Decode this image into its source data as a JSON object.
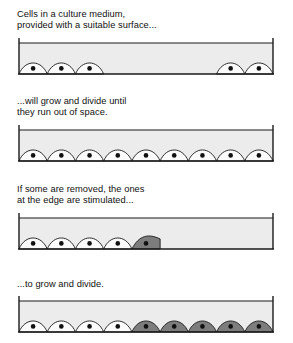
{
  "figure": {
    "background_color": "#ffffff",
    "text_color": "#111111"
  },
  "colors": {
    "medium_fill": "#ececec",
    "cell_light_fill": "#fbfbfb",
    "cell_dark_fill": "#7d7d7d",
    "nucleus": "#111111",
    "outline": "#1a1a1a",
    "surface_line": "#1a1a1a"
  },
  "panels": [
    {
      "id": "panel-1",
      "caption": "Cells in a culture medium,\nprovided with a suitable surface...",
      "dish": {
        "width": 258,
        "height": 40,
        "wall_top": 2,
        "floor_y": 38,
        "cell_count": 5,
        "cells": [
          {
            "index": 0,
            "slot": 0,
            "state": "normal",
            "fill": "#fbfbfb"
          },
          {
            "index": 1,
            "slot": 1,
            "state": "normal",
            "fill": "#fbfbfb"
          },
          {
            "index": 2,
            "slot": 2,
            "state": "normal",
            "fill": "#fbfbfb"
          },
          {
            "index": 3,
            "slot": 7,
            "state": "normal",
            "fill": "#fbfbfb"
          },
          {
            "index": 4,
            "slot": 8,
            "state": "normal",
            "fill": "#fbfbfb"
          }
        ]
      }
    },
    {
      "id": "panel-2",
      "caption": "...will grow and divide until\nthey run out of space.",
      "dish": {
        "width": 258,
        "height": 40,
        "wall_top": 2,
        "floor_y": 38,
        "cell_count": 9,
        "cells": [
          {
            "index": 0,
            "slot": 0,
            "state": "normal",
            "fill": "#fbfbfb"
          },
          {
            "index": 1,
            "slot": 1,
            "state": "normal",
            "fill": "#fbfbfb"
          },
          {
            "index": 2,
            "slot": 2,
            "state": "normal",
            "fill": "#fbfbfb"
          },
          {
            "index": 3,
            "slot": 3,
            "state": "normal",
            "fill": "#fbfbfb"
          },
          {
            "index": 4,
            "slot": 4,
            "state": "normal",
            "fill": "#fbfbfb"
          },
          {
            "index": 5,
            "slot": 5,
            "state": "normal",
            "fill": "#fbfbfb"
          },
          {
            "index": 6,
            "slot": 6,
            "state": "normal",
            "fill": "#fbfbfb"
          },
          {
            "index": 7,
            "slot": 7,
            "state": "normal",
            "fill": "#fbfbfb"
          },
          {
            "index": 8,
            "slot": 8,
            "state": "normal",
            "fill": "#fbfbfb"
          }
        ]
      }
    },
    {
      "id": "panel-3",
      "caption": "If some are removed, the ones\nat the edge are stimulated...",
      "dish": {
        "width": 258,
        "height": 40,
        "wall_top": 2,
        "floor_y": 38,
        "cell_count": 5,
        "cells": [
          {
            "index": 0,
            "slot": 0,
            "state": "normal",
            "fill": "#fbfbfb"
          },
          {
            "index": 1,
            "slot": 1,
            "state": "normal",
            "fill": "#fbfbfb"
          },
          {
            "index": 2,
            "slot": 2,
            "state": "normal",
            "fill": "#fbfbfb"
          },
          {
            "index": 3,
            "slot": 3,
            "state": "normal",
            "fill": "#fbfbfb"
          },
          {
            "index": 4,
            "slot": 4,
            "state": "stimulated",
            "fill": "#7d7d7d",
            "edge": "flat-right"
          }
        ]
      }
    },
    {
      "id": "panel-4",
      "caption": "...to grow and divide.",
      "dish": {
        "width": 258,
        "height": 40,
        "wall_top": 2,
        "floor_y": 38,
        "cell_count": 9,
        "cells": [
          {
            "index": 0,
            "slot": 0,
            "state": "normal",
            "fill": "#fbfbfb"
          },
          {
            "index": 1,
            "slot": 1,
            "state": "normal",
            "fill": "#fbfbfb"
          },
          {
            "index": 2,
            "slot": 2,
            "state": "normal",
            "fill": "#fbfbfb"
          },
          {
            "index": 3,
            "slot": 3,
            "state": "normal",
            "fill": "#fbfbfb"
          },
          {
            "index": 4,
            "slot": 4,
            "state": "stimulated",
            "fill": "#7d7d7d"
          },
          {
            "index": 5,
            "slot": 5,
            "state": "stimulated",
            "fill": "#7d7d7d"
          },
          {
            "index": 6,
            "slot": 6,
            "state": "stimulated",
            "fill": "#7d7d7d"
          },
          {
            "index": 7,
            "slot": 7,
            "state": "stimulated",
            "fill": "#7d7d7d"
          },
          {
            "index": 8,
            "slot": 8,
            "state": "stimulated",
            "fill": "#7d7d7d"
          }
        ]
      }
    }
  ]
}
